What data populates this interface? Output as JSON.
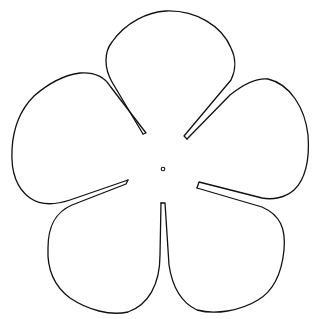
{
  "figure": {
    "petal_count": 5,
    "petals": [
      {
        "id": "top",
        "label": "top petal"
      },
      {
        "id": "upper-right",
        "label": "upper right petal"
      },
      {
        "id": "lower-right",
        "label": "lower right petal"
      },
      {
        "id": "lower-left",
        "label": "lower left petal"
      },
      {
        "id": "upper-left",
        "label": "upper left petal"
      }
    ],
    "center_mark": "small circle",
    "colors": {
      "line": "#111111",
      "background": "#ffffff"
    }
  }
}
